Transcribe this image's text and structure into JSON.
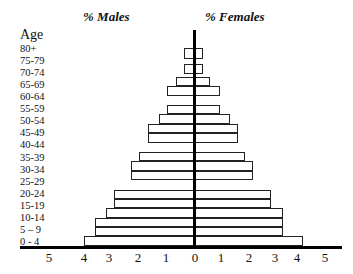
{
  "chart_data": {
    "type": "bar",
    "subtype": "population-pyramid",
    "title_left": "% Males",
    "title_right": "% Females",
    "ylabel": "Age",
    "categories": [
      "80+",
      "75-79",
      "70-74",
      "65-69",
      "60-64",
      "55-59",
      "50-54",
      "45-49",
      "40-44",
      "35-39",
      "30-34",
      "25-29",
      "20-24",
      "15-19",
      "10-14",
      "5 – 9",
      "0 - 4"
    ],
    "series": [
      {
        "name": "% Males",
        "side": "left",
        "values": [
          0.4,
          0.4,
          0.7,
          1.0,
          1.0,
          1.3,
          1.7,
          1.7,
          2.0,
          2.3,
          2.3,
          2.9,
          2.9,
          3.2,
          3.6,
          3.6,
          4.0
        ]
      },
      {
        "name": "% Females",
        "side": "right",
        "values": [
          0.3,
          0.3,
          0.6,
          1.0,
          1.0,
          1.4,
          1.7,
          1.7,
          2.0,
          2.3,
          2.3,
          3.0,
          3.0,
          3.5,
          3.5,
          3.5,
          4.3
        ]
      }
    ],
    "x_ticks_left": [
      "5",
      "4",
      "3",
      "2",
      "1"
    ],
    "x_ticks_right": [
      "0",
      "1",
      "2",
      "3",
      "4",
      "5"
    ],
    "xlim": [
      -5,
      5
    ],
    "grid": false,
    "legend": "none"
  },
  "layout": {
    "bar_tops": [
      48,
      64,
      77,
      86,
      105,
      114,
      124,
      133,
      152,
      161,
      171,
      190,
      199,
      208,
      218,
      227,
      236
    ],
    "bar_heights": [
      11,
      10,
      9,
      10,
      9,
      10,
      9,
      10,
      9,
      10,
      9,
      9,
      9,
      10,
      9,
      9,
      10
    ],
    "label_tops": [
      43,
      55,
      67,
      79,
      91,
      103,
      115,
      127,
      139,
      152,
      164,
      176,
      188,
      200,
      212,
      224,
      236
    ],
    "left_tick_x": [
      49,
      84,
      109,
      138,
      166
    ],
    "right_tick_x": [
      195,
      221,
      249,
      275,
      297,
      325
    ],
    "center_x": 195,
    "px_per_unit_left": 27.8,
    "px_per_unit_right": 25.2
  }
}
